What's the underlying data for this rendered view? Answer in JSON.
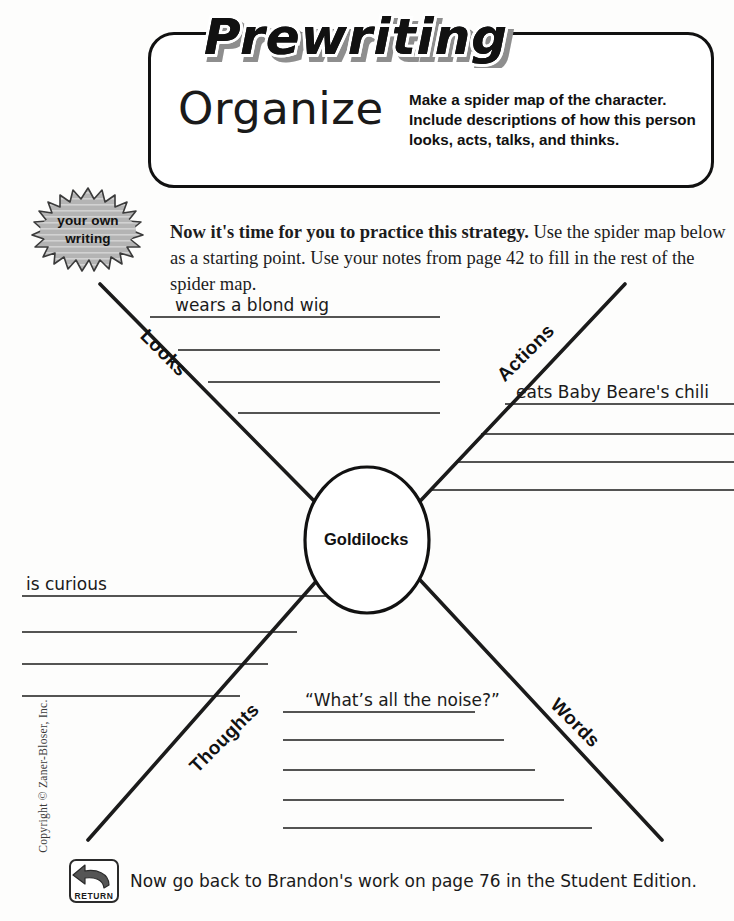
{
  "header": {
    "banner_title": "Prewriting",
    "stage_title": "Organize",
    "directive": "Make a spider map of the character. Include descriptions of how this person looks, acts, talks, and thinks."
  },
  "badge": {
    "line1": "your own",
    "line2": "writing"
  },
  "intro": {
    "bold_lead": "Now it's time for you to practice this strategy.",
    "rest": " Use the spider map below as a starting point. Use your notes from page 42 to fill in the rest of the spider map."
  },
  "spider_map": {
    "center": "Goldilocks",
    "branches": [
      {
        "label": "Looks",
        "position": "top-left",
        "entry": "wears a blond wig",
        "line_count": 4
      },
      {
        "label": "Actions",
        "position": "top-right",
        "entry": "eats Baby Beare's chili",
        "line_count": 4
      },
      {
        "label": "Thoughts",
        "position": "bottom-left",
        "entry": "is curious",
        "line_count": 4
      },
      {
        "label": "Words",
        "position": "bottom-right",
        "entry": "“What’s all the noise?”",
        "line_count": 5
      }
    ]
  },
  "footer": {
    "icon_label": "RETURN",
    "text": "Now go back to Brandon's work on page 76 in the Student Edition."
  },
  "copyright": "Copyright © Zaner-Bloser, Inc.",
  "colors": {
    "ink": "#111111",
    "rule": "#222222",
    "badge_gray": "#a8a8a8",
    "paper": "#fdfdfc"
  }
}
